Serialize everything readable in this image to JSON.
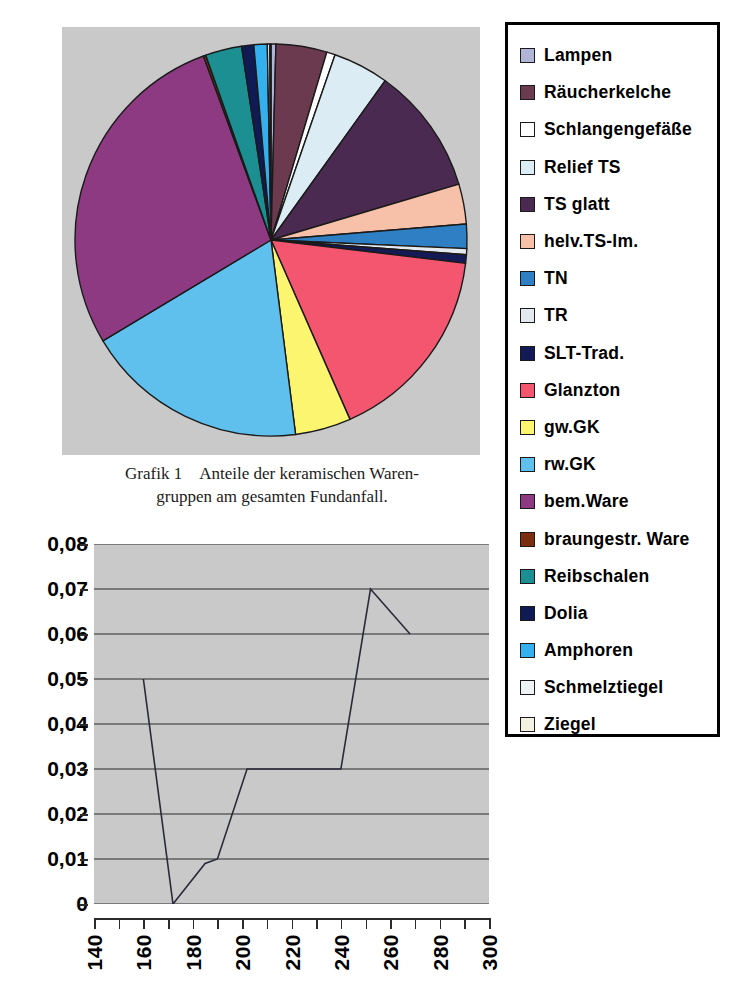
{
  "figure": {
    "caption_tag": "Grafik 1",
    "caption_line1": "Anteile der keramischen Waren-",
    "caption_line2": "gruppen am gesamten Fundanfall.",
    "plot_background": "#c9c9c9",
    "outline_color": "#1a1a1a"
  },
  "legend": {
    "border_color": "#000000",
    "items": [
      {
        "label": "Lampen",
        "color": "#b0b4d6"
      },
      {
        "label": "Räucherkelche",
        "color": "#6b3a4e"
      },
      {
        "label": "Schlangengefäße",
        "color": "#ffffff"
      },
      {
        "label": "Relief TS",
        "color": "#dcecf4"
      },
      {
        "label": "TS glatt",
        "color": "#4b2a52"
      },
      {
        "label": "helv.TS-lm.",
        "color": "#f7c0a8"
      },
      {
        "label": "TN",
        "color": "#2f7fc4"
      },
      {
        "label": "TR",
        "color": "#e4e8ef"
      },
      {
        "label": "SLT-Trad.",
        "color": "#131a55"
      },
      {
        "label": "Glanzton",
        "color": "#f5566f"
      },
      {
        "label": "gw.GK",
        "color": "#fcf570"
      },
      {
        "label": "rw.GK",
        "color": "#5fc0ee"
      },
      {
        "label": "bem.Ware",
        "color": "#8e3a82"
      },
      {
        "label": "braungestr. Ware",
        "color": "#7a2f10"
      },
      {
        "label": "Reibschalen",
        "color": "#1b8f91"
      },
      {
        "label": "Dolia",
        "color": "#101a54"
      },
      {
        "label": "Amphoren",
        "color": "#35b0ee"
      },
      {
        "label": "Schmelztiegel",
        "color": "#eef4f6"
      },
      {
        "label": "Ziegel",
        "color": "#f3f2e2"
      }
    ]
  },
  "chart_data": [
    {
      "type": "pie",
      "title": "Anteile der keramischen Warengruppen am gesamten Fundanfall",
      "start_angle_deg": -90,
      "direction": "clockwise",
      "legend_position": "right",
      "categories": [
        "Lampen",
        "Räucherkelche",
        "Schlangengefäße",
        "Relief TS",
        "TS glatt",
        "helv.TS-lm.",
        "TN",
        "TR",
        "SLT-Trad.",
        "Glanzton",
        "gw.GK",
        "rw.GK",
        "bem.Ware",
        "braungestr. Ware",
        "Reibschalen",
        "Dolia",
        "Amphoren",
        "Schmelztiegel",
        "Ziegel"
      ],
      "values": [
        0.4,
        4.2,
        0.7,
        4.6,
        10.5,
        3.3,
        2.0,
        0.5,
        0.7,
        16.5,
        4.6,
        18.4,
        28.0,
        0.2,
        3.0,
        1.0,
        1.1,
        0.2,
        0.1
      ],
      "unit": "percent",
      "colors": [
        "#b0b4d6",
        "#6b3a4e",
        "#ffffff",
        "#dcecf4",
        "#4b2a52",
        "#f7c0a8",
        "#2f7fc4",
        "#e4e8ef",
        "#131a55",
        "#f5566f",
        "#fcf570",
        "#5fc0ee",
        "#8e3a82",
        "#7a2f10",
        "#1b8f91",
        "#101a54",
        "#35b0ee",
        "#eef4f6",
        "#f3f2e2"
      ]
    },
    {
      "type": "line",
      "title": "",
      "xlabel": "",
      "ylabel": "",
      "xlim": [
        140,
        300
      ],
      "ylim": [
        0,
        0.08
      ],
      "grid": "horizontal",
      "y_ticks": [
        "0",
        "0,01",
        "0,02",
        "0,03",
        "0,04",
        "0,05",
        "0,06",
        "0,07",
        "0,08"
      ],
      "y_tick_values": [
        0,
        0.01,
        0.02,
        0.03,
        0.04,
        0.05,
        0.06,
        0.07,
        0.08
      ],
      "x_ticks": [
        "140",
        "160",
        "180",
        "200",
        "220",
        "240",
        "260",
        "280",
        "300"
      ],
      "x_tick_values": [
        140,
        160,
        180,
        200,
        220,
        240,
        260,
        280,
        300
      ],
      "x_minor_step": 10,
      "series": [
        {
          "name": "Anteil",
          "x": [
            160,
            172,
            185,
            190,
            202,
            240,
            252,
            268
          ],
          "y": [
            0.05,
            0.0,
            0.009,
            0.01,
            0.03,
            0.03,
            0.07,
            0.06
          ]
        }
      ],
      "line_color": "#2a2a3a"
    }
  ]
}
